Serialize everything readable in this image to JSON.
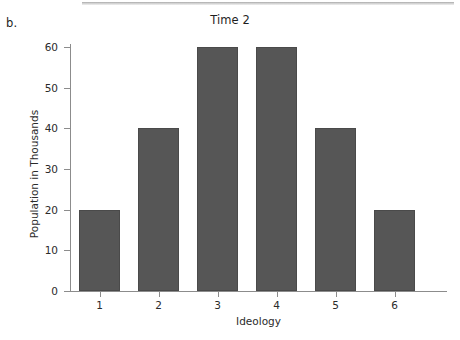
{
  "panel": {
    "letter": "b."
  },
  "chart_data": {
    "type": "bar",
    "title": "Time 2",
    "xlabel": "Ideology",
    "ylabel": "Population in Thousands",
    "categories": [
      "1",
      "2",
      "3",
      "4",
      "5",
      "6"
    ],
    "values": [
      20,
      40,
      60,
      60,
      40,
      20
    ],
    "ylim": [
      0,
      62
    ],
    "yticks": [
      0,
      10,
      20,
      30,
      40,
      50,
      60
    ],
    "ytick_labels": [
      "0",
      "10",
      "20",
      "30",
      "40",
      "50",
      "60"
    ],
    "grid": false,
    "legend": null,
    "series": [
      {
        "name": "Population",
        "values": [
          20,
          40,
          60,
          60,
          40,
          20
        ]
      }
    ],
    "bar_color": "#565656",
    "axis_color": "#8c8c8c"
  }
}
